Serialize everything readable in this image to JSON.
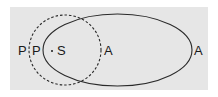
{
  "diagram": {
    "type": "venn",
    "colors": {
      "background": "#e6e6e6",
      "stroke": "#2a2a2a",
      "text": "#1a1a1a"
    },
    "shapes": [
      {
        "name": "dashed-circle",
        "style": "dashed"
      },
      {
        "name": "solid-ellipse",
        "style": "solid"
      }
    ],
    "labels": {
      "p_outer": "P",
      "p_inner": "P",
      "s": "S",
      "a_inner": "A",
      "a_outer": "A"
    }
  }
}
